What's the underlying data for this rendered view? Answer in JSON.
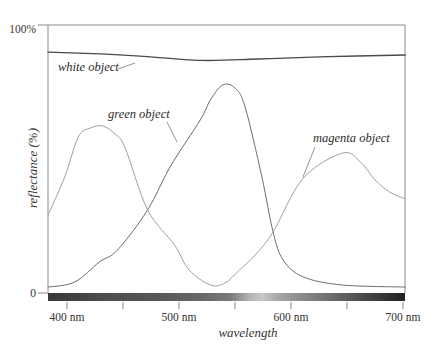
{
  "chart_data": {
    "type": "line",
    "title": "",
    "xlabel": "wavelength",
    "ylabel": "reflectance (%)",
    "xlim": [
      383,
      702
    ],
    "ylim": [
      0,
      100
    ],
    "grid": false,
    "legend": "inline annotations with leader lines",
    "xticks": [
      400,
      450,
      500,
      550,
      600,
      650,
      700
    ],
    "xtick_labels": [
      "400 nm",
      "",
      "500 nm",
      "",
      "600 nm",
      "",
      "700 nm"
    ],
    "yticks": [
      0,
      100
    ],
    "ytick_labels": [
      "0",
      "100%"
    ],
    "series": [
      {
        "name": "white object",
        "color": "#4a4a4a",
        "width": 1.3,
        "x": [
          383,
          430,
          465,
          520,
          570,
          625,
          702
        ],
        "y": [
          89.9,
          89.2,
          88.4,
          86.8,
          87.3,
          88.1,
          88.8
        ]
      },
      {
        "name": "green object",
        "color": "#6e6e6e",
        "width": 1.0,
        "x": [
          383,
          407,
          429,
          445,
          472,
          492,
          519,
          528,
          539,
          550,
          559,
          574,
          584,
          593,
          611,
          646,
          702
        ],
        "y": [
          2.2,
          4.1,
          11.6,
          16.0,
          31.0,
          47.0,
          64.6,
          72.0,
          77.6,
          76.5,
          69.4,
          43.3,
          22.8,
          12.3,
          6.0,
          3.0,
          2.2
        ]
      },
      {
        "name": "magenta object",
        "color": "#a0a0a0",
        "width": 1.0,
        "x": [
          383,
          398,
          410,
          421,
          432,
          443,
          452,
          472,
          496,
          509,
          528,
          541,
          554,
          568,
          584,
          611,
          646,
          662,
          675,
          688,
          702
        ],
        "y": [
          29.1,
          43.3,
          58.2,
          61.6,
          62.3,
          59.3,
          54.1,
          31.0,
          17.9,
          8.6,
          3.0,
          3.7,
          8.6,
          14.2,
          22.8,
          42.9,
          52.2,
          48.9,
          42.2,
          37.7,
          35.1
        ]
      }
    ],
    "annotations": [
      {
        "text": "white object"
      },
      {
        "text": "green object"
      },
      {
        "text": "magenta object"
      }
    ],
    "spectrum_bar": {
      "description": "grayscale rendering of visible spectrum along x-axis",
      "stops": [
        {
          "offset": "0%",
          "color": "#383838"
        },
        {
          "offset": "15%",
          "color": "#4c4c4c"
        },
        {
          "offset": "30%",
          "color": "#575757"
        },
        {
          "offset": "43%",
          "color": "#676767"
        },
        {
          "offset": "51%",
          "color": "#7a7a7a"
        },
        {
          "offset": "57%",
          "color": "#b8b8b8"
        },
        {
          "offset": "60%",
          "color": "#c8c8c8"
        },
        {
          "offset": "65%",
          "color": "#a4a4a4"
        },
        {
          "offset": "73%",
          "color": "#838383"
        },
        {
          "offset": "84%",
          "color": "#5a5a5a"
        },
        {
          "offset": "94%",
          "color": "#363636"
        },
        {
          "offset": "100%",
          "color": "#222222"
        }
      ]
    }
  }
}
